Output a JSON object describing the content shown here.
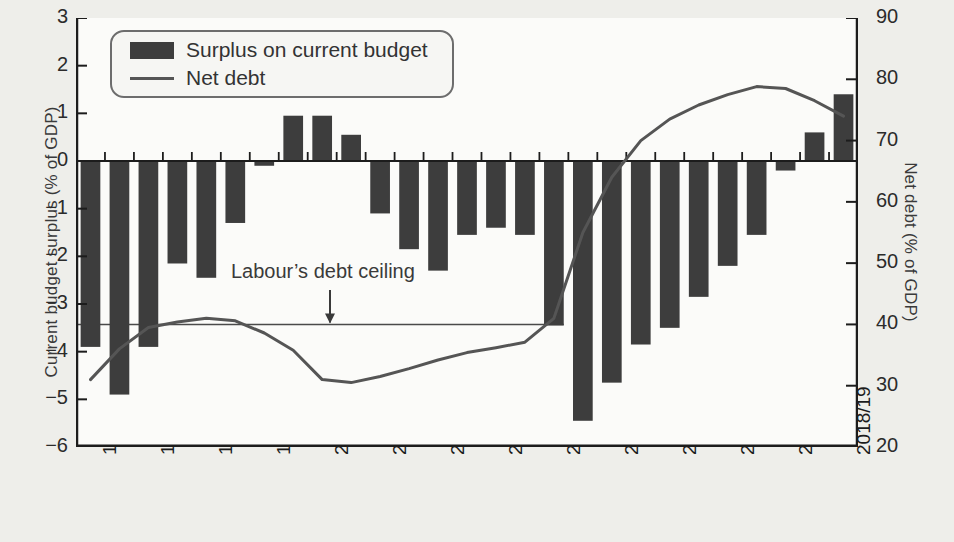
{
  "chart_data": {
    "type": "bar",
    "title": "",
    "xlabel": "",
    "ylabel": "Current budget surplus (% of GDP)",
    "ylabel_right": "Net debt (% of GDP)",
    "ylim": [
      -6,
      3
    ],
    "ylim_right": [
      20,
      90
    ],
    "yticks": [
      "3",
      "2",
      "1",
      "0",
      "−1",
      "−2",
      "−3",
      "−4",
      "−5",
      "−6"
    ],
    "ytick_values": [
      3,
      2,
      1,
      0,
      -1,
      -2,
      -3,
      -4,
      -5,
      -6
    ],
    "yticks_right": [
      "90",
      "80",
      "70",
      "60",
      "50",
      "40",
      "30",
      "20"
    ],
    "ytick_values_right": [
      90,
      80,
      70,
      60,
      50,
      40,
      30,
      20
    ],
    "grid": false,
    "legend_position": "top-left",
    "categories": [
      "1992/93",
      "1993/94",
      "1994/95",
      "1995/96",
      "1996/97",
      "1997/98",
      "1998/99",
      "1999/00",
      "2000/01",
      "2001/02",
      "2002/03",
      "2003/04",
      "2004/05",
      "2005/06",
      "2006/07",
      "2007/08",
      "2008/09",
      "2009/10",
      "2010/11",
      "2011/12",
      "2012/13",
      "2013/14",
      "2014/15",
      "2015/16",
      "2016/17",
      "2017/18",
      "2018/19"
    ],
    "xtick_labels": [
      "1992/93",
      "1994/95",
      "1996/97",
      "1998/99",
      "2000/01",
      "2002/03",
      "2004/05",
      "2006/07",
      "2008/09",
      "2010/11",
      "2012/13",
      "2014/15",
      "2016/17",
      "2018/19"
    ],
    "series": [
      {
        "name": "Surplus on current budget",
        "type": "bar",
        "axis": "left",
        "color": "#3d3d3d",
        "values": [
          -3.9,
          -4.9,
          -3.9,
          -2.15,
          -2.45,
          -1.3,
          -0.1,
          0.95,
          0.95,
          0.55,
          -1.1,
          -1.85,
          -2.3,
          -1.55,
          -1.4,
          -1.55,
          -3.45,
          -5.45,
          -4.65,
          -3.85,
          -3.5,
          -2.85,
          -2.2,
          -1.55,
          -0.2,
          0.6,
          1.4
        ]
      },
      {
        "name": "Net debt",
        "type": "line",
        "axis": "right",
        "color": "#555555",
        "values": [
          31.0,
          36.0,
          39.5,
          40.4,
          41.0,
          40.6,
          38.6,
          35.8,
          31.0,
          30.5,
          31.5,
          32.8,
          34.2,
          35.4,
          36.2,
          37.1,
          41.0,
          55.0,
          64.0,
          70.0,
          73.5,
          75.8,
          77.5,
          78.8,
          78.5,
          76.5,
          74.0
        ]
      }
    ],
    "annotations": [
      {
        "name": "labours-debt-ceiling",
        "text": "Labour’s debt ceiling",
        "reference_line_value_right": 40,
        "reference_line_from_category": "1992/93",
        "reference_line_to_category": "2008/09"
      }
    ]
  },
  "legend": {
    "items": [
      {
        "label": "Surplus on current budget",
        "marker": "bar-swatch"
      },
      {
        "label": "Net debt",
        "marker": "line-swatch"
      }
    ]
  },
  "axes": {
    "left_title": "Current budget surplus (% of GDP)",
    "right_title": "Net debt (% of GDP)"
  }
}
